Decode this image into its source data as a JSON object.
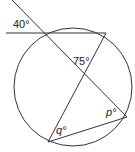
{
  "diagram": {
    "type": "circle-geometry",
    "angles": {
      "exterior": "40°",
      "intersection": "75°",
      "p": "p°",
      "q": "q°"
    },
    "colors": {
      "stroke": "#333333",
      "background": "#ffffff"
    }
  }
}
